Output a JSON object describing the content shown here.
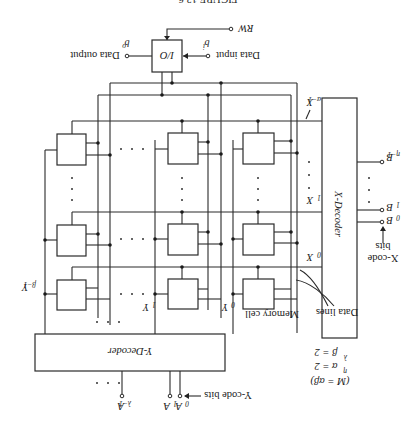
{
  "figure": {
    "orientation": "rotated-180",
    "caption_partial": "FIGURE 13.6"
  },
  "io_block": {
    "label": "I/O",
    "rw_label": "RW",
    "data_input_label": "Data input",
    "data_input_symbol": "b",
    "data_input_sub": "i",
    "data_output_label": "Data output",
    "data_output_symbol": "b",
    "data_output_sub": "o"
  },
  "x_decoder": {
    "label": "X-Decoder",
    "inputs": [
      {
        "symbol": "B",
        "sub": "0"
      },
      {
        "symbol": "B",
        "sub": "1"
      },
      {
        "symbol": "B",
        "sub": "η−1"
      }
    ],
    "code_label_line1": "X-code",
    "code_label_line2": "bits",
    "outputs": [
      {
        "symbol": "X",
        "sub": "0"
      },
      {
        "symbol": "X",
        "sub": "1"
      },
      {
        "symbol": "X",
        "sub": "α−1"
      }
    ]
  },
  "y_decoder": {
    "label": "Y-Decoder",
    "inputs": [
      {
        "symbol": "A",
        "sub": "0"
      },
      {
        "symbol": "A",
        "sub": "1"
      },
      {
        "symbol": "A",
        "sub": "λ−1"
      }
    ],
    "code_label": "Y-code bits",
    "outputs": [
      {
        "symbol": "Y",
        "sub": "0"
      },
      {
        "symbol": "Y",
        "sub": "1"
      },
      {
        "symbol": "Y",
        "sub": "β−1"
      }
    ]
  },
  "annotations": {
    "memory_cell": "Memory cell",
    "data_lines": "Data lines",
    "eq_m": "(M = αβ)",
    "eq_alpha": "α = 2",
    "eq_alpha_exp": "η",
    "eq_beta": "β = 2",
    "eq_beta_exp": "λ"
  },
  "grid": {
    "rows_shown": 3,
    "cols_shown": 3,
    "ellipsis": "· · ·"
  }
}
